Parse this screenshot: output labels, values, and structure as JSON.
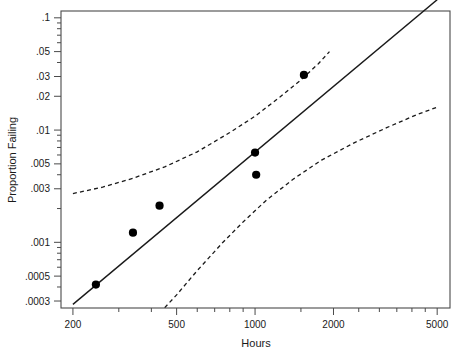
{
  "chart_data": {
    "type": "scatter",
    "title": "",
    "xlabel": "Hours",
    "ylabel": "Proportion Failing",
    "xscale": "log",
    "yscale": "log",
    "xlim": [
      180,
      5600
    ],
    "ylim": [
      0.00026,
      0.115
    ],
    "grid": false,
    "legend": null,
    "x_ticks": [
      {
        "value": 200,
        "label": "200"
      },
      {
        "value": 500,
        "label": "500"
      },
      {
        "value": 1000,
        "label": "1000"
      },
      {
        "value": 2000,
        "label": "2000"
      },
      {
        "value": 5000,
        "label": "5000"
      }
    ],
    "y_ticks": [
      {
        "value": 0.1,
        "label": ".1"
      },
      {
        "value": 0.05,
        "label": ".05"
      },
      {
        "value": 0.03,
        "label": ".03"
      },
      {
        "value": 0.02,
        "label": ".02"
      },
      {
        "value": 0.01,
        "label": ".01"
      },
      {
        "value": 0.005,
        "label": ".005"
      },
      {
        "value": 0.003,
        "label": ".003"
      },
      {
        "value": 0.001,
        "label": ".001"
      },
      {
        "value": 0.0005,
        "label": ".0005"
      },
      {
        "value": 0.0003,
        "label": ".0003"
      }
    ],
    "x_minor_ticks": [
      300,
      400,
      600,
      700,
      800,
      900,
      1500,
      2500,
      3000,
      3500,
      4000,
      4500
    ],
    "y_minor_ticks": [
      0.0004,
      0.0006,
      0.0007,
      0.0008,
      0.0009,
      0.002,
      0.004,
      0.006,
      0.007,
      0.008,
      0.009,
      0.04,
      0.06,
      0.07,
      0.08,
      0.09
    ],
    "series": [
      {
        "name": "observed",
        "type": "scatter",
        "marker": "filled-circle",
        "color": "#000000",
        "points": [
          {
            "x": 245,
            "y": 0.00042
          },
          {
            "x": 340,
            "y": 0.00122
          },
          {
            "x": 430,
            "y": 0.00212
          },
          {
            "x": 1000,
            "y": 0.0063
          },
          {
            "x": 1010,
            "y": 0.004
          },
          {
            "x": 1540,
            "y": 0.031
          }
        ]
      },
      {
        "name": "fitted-line",
        "type": "line",
        "style": "solid",
        "color": "#1a1a1a",
        "points": [
          {
            "x": 200,
            "y": 0.00028
          },
          {
            "x": 5000,
            "y": 0.145
          }
        ]
      },
      {
        "name": "upper-confidence-band",
        "type": "line",
        "style": "dashed",
        "color": "#1a1a1a",
        "points": [
          {
            "x": 200,
            "y": 0.00272
          },
          {
            "x": 260,
            "y": 0.0031
          },
          {
            "x": 340,
            "y": 0.00372
          },
          {
            "x": 450,
            "y": 0.0047
          },
          {
            "x": 600,
            "y": 0.0064
          },
          {
            "x": 800,
            "y": 0.0095
          },
          {
            "x": 1000,
            "y": 0.0133
          },
          {
            "x": 1250,
            "y": 0.0198
          },
          {
            "x": 1500,
            "y": 0.028
          },
          {
            "x": 1750,
            "y": 0.039
          },
          {
            "x": 1930,
            "y": 0.05
          }
        ]
      },
      {
        "name": "lower-confidence-band",
        "type": "line",
        "style": "dashed",
        "color": "#1a1a1a",
        "points": [
          {
            "x": 450,
            "y": 0.000262
          },
          {
            "x": 500,
            "y": 0.00034
          },
          {
            "x": 600,
            "y": 0.00056
          },
          {
            "x": 750,
            "y": 0.00099
          },
          {
            "x": 900,
            "y": 0.00152
          },
          {
            "x": 1100,
            "y": 0.00235
          },
          {
            "x": 1400,
            "y": 0.00365
          },
          {
            "x": 1800,
            "y": 0.0054
          },
          {
            "x": 2400,
            "y": 0.0077
          },
          {
            "x": 3200,
            "y": 0.0105
          },
          {
            "x": 4200,
            "y": 0.0138
          },
          {
            "x": 5000,
            "y": 0.016
          }
        ]
      }
    ]
  },
  "axes": {
    "x_title": "Hours",
    "y_title": "Proportion Failing"
  }
}
